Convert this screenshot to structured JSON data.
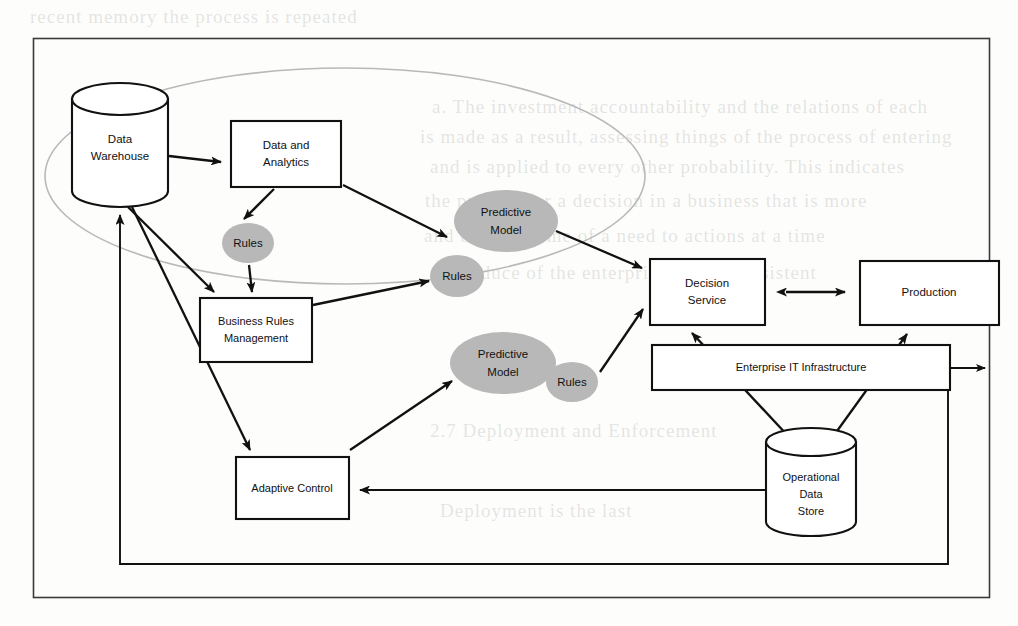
{
  "page": {
    "width": 1018,
    "height": 626,
    "background_color": "#fdfdfc",
    "frame_color": "#3b3b3b"
  },
  "bleed_through_text": [
    {
      "text": "recent memory the process is repeated",
      "x": 30,
      "y": 6
    },
    {
      "text": "a. The investment accountability and the relations of each",
      "x": 432,
      "y": 96
    },
    {
      "text": "is made as a result, assessing things of the process of entering",
      "x": 420,
      "y": 126
    },
    {
      "text": "and is applied to every other probability. This indicates",
      "x": 430,
      "y": 156
    },
    {
      "text": "the process for a decision in a business that is more",
      "x": 425,
      "y": 190
    },
    {
      "text": "and be not. Some of a need to actions at a time",
      "x": 424,
      "y": 225
    },
    {
      "text": "the reduce of the enterprise is in a consistent",
      "x": 432,
      "y": 262
    },
    {
      "text": "2.7 Deployment and Enforcement",
      "x": 430,
      "y": 420
    },
    {
      "text": "Deployment is the last",
      "x": 440,
      "y": 500
    }
  ],
  "diagram": {
    "type": "flow-diagram",
    "analytics_zone": {
      "label": "analytics-scope-oval",
      "cx": 345,
      "cy": 176,
      "rx": 300,
      "ry": 108,
      "color": "#b9b9b9"
    },
    "nodes": [
      {
        "id": "data-warehouse",
        "label_lines": [
          "Data",
          "Warehouse"
        ],
        "shape": "cylinder",
        "x": 72,
        "y": 85,
        "w": 96,
        "h": 120
      },
      {
        "id": "data-and-analytics",
        "label_lines": [
          "Data and",
          "Analytics"
        ],
        "shape": "rect",
        "x": 231,
        "y": 121,
        "w": 110,
        "h": 66
      },
      {
        "id": "rules-1",
        "label_lines": [
          "Rules"
        ],
        "shape": "ellipse-gray",
        "cx": 248,
        "cy": 243,
        "rx": 26,
        "ry": 20
      },
      {
        "id": "business-rules-management",
        "label_lines": [
          "Business Rules",
          "Management"
        ],
        "shape": "rect",
        "x": 200,
        "y": 298,
        "w": 112,
        "h": 64
      },
      {
        "id": "predictive-model-1",
        "label_lines": [
          "Predictive",
          "Model"
        ],
        "shape": "ellipse-gray",
        "cx": 506,
        "cy": 221,
        "rx": 52,
        "ry": 31
      },
      {
        "id": "rules-2",
        "label_lines": [
          "Rules"
        ],
        "shape": "ellipse-gray",
        "cx": 457,
        "cy": 276,
        "rx": 27,
        "ry": 21
      },
      {
        "id": "predictive-model-2",
        "label_lines": [
          "Predictive",
          "Model"
        ],
        "shape": "ellipse-gray",
        "cx": 503,
        "cy": 363,
        "rx": 53,
        "ry": 31
      },
      {
        "id": "rules-3",
        "label_lines": [
          "Rules"
        ],
        "shape": "ellipse-gray",
        "cx": 572,
        "cy": 382,
        "rx": 26,
        "ry": 20
      },
      {
        "id": "adaptive-control",
        "label_lines": [
          "Adaptive Control"
        ],
        "shape": "rect",
        "x": 236,
        "y": 457,
        "w": 113,
        "h": 62
      },
      {
        "id": "decision-service",
        "label_lines": [
          "Decision",
          "Service"
        ],
        "shape": "rect",
        "x": 650,
        "y": 259,
        "w": 115,
        "h": 66
      },
      {
        "id": "production",
        "label_lines": [
          "Production"
        ],
        "shape": "rect",
        "x": 860,
        "y": 261,
        "w": 139,
        "h": 64
      },
      {
        "id": "enterprise-it-infrastructure",
        "label_lines": [
          "Enterprise IT Infrastructure"
        ],
        "shape": "rect-wide",
        "x": 652,
        "y": 345,
        "w": 298,
        "h": 45
      },
      {
        "id": "operational-data-store",
        "label_lines": [
          "Operational",
          "Data",
          "Store"
        ],
        "shape": "cylinder",
        "x": 766,
        "y": 428,
        "w": 90,
        "h": 108
      }
    ],
    "connections": [
      {
        "from": "data-warehouse",
        "to": "data-and-analytics",
        "style": "arrow"
      },
      {
        "from": "data-and-analytics",
        "to": "rules-1",
        "style": "arrow"
      },
      {
        "from": "data-and-analytics",
        "to": "predictive-model-1",
        "style": "arrow"
      },
      {
        "from": "rules-1",
        "to": "business-rules-management",
        "style": "arrow"
      },
      {
        "from": "data-warehouse",
        "to": "business-rules-management",
        "style": "arrow"
      },
      {
        "from": "data-warehouse",
        "to": "adaptive-control",
        "style": "arrow"
      },
      {
        "from": "business-rules-management",
        "to": "rules-2",
        "style": "arrow"
      },
      {
        "from": "predictive-model-1",
        "to": "decision-service",
        "style": "arrow"
      },
      {
        "from": "rules-2",
        "to": "decision-service",
        "style": "arrow"
      },
      {
        "from": "adaptive-control",
        "to": "predictive-model-2",
        "style": "arrow"
      },
      {
        "from": "rules-3",
        "to": "decision-service",
        "style": "arrow"
      },
      {
        "from": "decision-service",
        "to": "production",
        "style": "double-arrow"
      },
      {
        "from": "decision-service",
        "to": "operational-data-store",
        "style": "double-arrow"
      },
      {
        "from": "production",
        "to": "operational-data-store",
        "style": "double-arrow"
      },
      {
        "from": "enterprise-it-infrastructure",
        "to": "external",
        "style": "arrow-out-right"
      },
      {
        "from": "operational-data-store",
        "to": "adaptive-control",
        "style": "arrow"
      },
      {
        "from": "enterprise-it-infrastructure",
        "to": "data-warehouse",
        "style": "feedback-loop"
      }
    ]
  }
}
